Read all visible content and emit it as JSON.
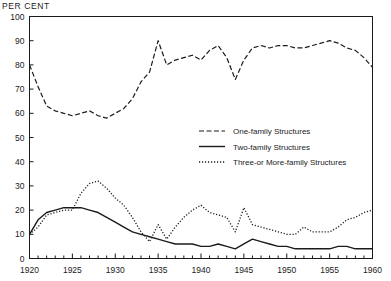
{
  "chart_data": {
    "type": "line",
    "title": "",
    "ylabel": "PER CENT",
    "xlabel": "",
    "xlim": [
      1920,
      1960
    ],
    "ylim": [
      0,
      100
    ],
    "grid": false,
    "legend_position": "center-right",
    "y_ticks": [
      0,
      10,
      20,
      30,
      40,
      50,
      60,
      70,
      80,
      90,
      100
    ],
    "x_ticks": [
      1920,
      1925,
      1930,
      1935,
      1940,
      1945,
      1950,
      1955,
      1960
    ],
    "x_minor_step": 1,
    "x": [
      1920,
      1921,
      1922,
      1923,
      1924,
      1925,
      1926,
      1927,
      1928,
      1929,
      1930,
      1931,
      1932,
      1933,
      1934,
      1935,
      1936,
      1937,
      1938,
      1939,
      1940,
      1941,
      1942,
      1943,
      1944,
      1945,
      1946,
      1947,
      1948,
      1949,
      1950,
      1951,
      1952,
      1953,
      1954,
      1955,
      1956,
      1957,
      1958,
      1959,
      1960
    ],
    "series": [
      {
        "name": "One-family Structures",
        "style": "dashed",
        "values": [
          80,
          71,
          63,
          61,
          60,
          59,
          60,
          61,
          59,
          58,
          60,
          62,
          66,
          73,
          77,
          90,
          80,
          82,
          83,
          84,
          82,
          86,
          88,
          83,
          74,
          82,
          87,
          88,
          87,
          88,
          88,
          87,
          87,
          88,
          89,
          90,
          89,
          87,
          86,
          83,
          79
        ]
      },
      {
        "name": "Two-family Structures",
        "style": "solid",
        "values": [
          10,
          16,
          19,
          20,
          21,
          21,
          21,
          20,
          19,
          17,
          15,
          13,
          11,
          10,
          9,
          8,
          7,
          6,
          6,
          6,
          5,
          5,
          6,
          5,
          4,
          6,
          8,
          7,
          6,
          5,
          5,
          4,
          4,
          4,
          4,
          4,
          5,
          5,
          4,
          4,
          4
        ]
      },
      {
        "name": "Three-or More-family Structures",
        "style": "dotted",
        "values": [
          10,
          13,
          18,
          19,
          20,
          20,
          27,
          31,
          32,
          29,
          25,
          22,
          17,
          11,
          7,
          14,
          8,
          13,
          17,
          20,
          22,
          19,
          18,
          17,
          11,
          21,
          14,
          13,
          12,
          11,
          10,
          10,
          13,
          11,
          11,
          11,
          13,
          16,
          17,
          19,
          20
        ]
      }
    ]
  },
  "legend": {
    "items": [
      {
        "label": "One-family Structures",
        "style": "dashed"
      },
      {
        "label": "Two-family Structures",
        "style": "solid"
      },
      {
        "label": "Three-or More-family Structures",
        "style": "dotted"
      }
    ]
  },
  "colors": {
    "ink": "#1b1b1b",
    "background": "#ffffff"
  }
}
